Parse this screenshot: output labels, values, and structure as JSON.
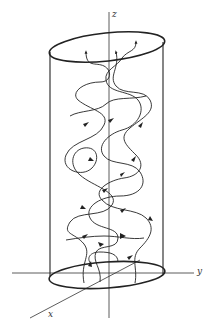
{
  "figure": {
    "axes": {
      "z_label": "z",
      "y_label": "y",
      "x_label": "x"
    },
    "colors": {
      "line": "#222222",
      "axis": "#333333",
      "background": "#ffffff"
    }
  }
}
